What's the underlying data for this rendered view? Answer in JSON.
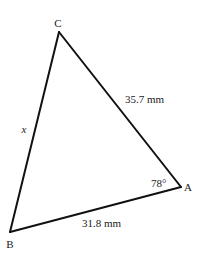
{
  "diagram": {
    "type": "triangle",
    "vertices": {
      "A": {
        "label": "A"
      },
      "B": {
        "label": "B"
      },
      "C": {
        "label": "C"
      }
    },
    "sides": {
      "CA": {
        "label": "35.7 mm",
        "length_mm": 35.7
      },
      "AB": {
        "label": "31.8 mm",
        "length_mm": 31.8
      },
      "BC": {
        "label": "x",
        "unknown": true
      }
    },
    "angles": {
      "A": {
        "label": "78°",
        "degrees": 78
      }
    },
    "colors": {
      "line": "#111111",
      "text": "#1a1a1a",
      "background": "#ffffff"
    }
  }
}
